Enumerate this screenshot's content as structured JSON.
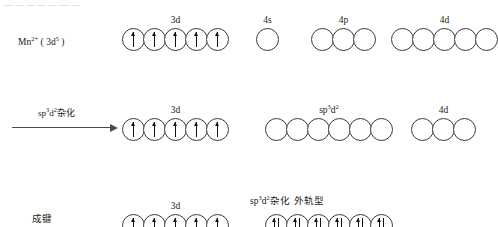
{
  "page": {
    "top_clipped_text": "— — — — — — —",
    "background": "#ffffff",
    "ink": "#1a1a1a"
  },
  "rows": [
    {
      "id": "row-1",
      "left_label_html": "Mn<sup>2+</sup> ( 3d<sup>5</sup> )",
      "left_label_text": "Mn2+ ( 3d5 )",
      "groups": [
        {
          "label": "3d",
          "label_text": "3d",
          "count": 5,
          "fill": "up",
          "left": 122,
          "touching": true
        },
        {
          "label": "4s",
          "label_text": "4s",
          "count": 1,
          "fill": "empty",
          "left": 256,
          "touching": true
        },
        {
          "label": "4p",
          "label_text": "4p",
          "count": 3,
          "fill": "empty",
          "left": 311,
          "touching": true
        },
        {
          "label": "4d",
          "label_text": "4d",
          "count": 5,
          "fill": "empty",
          "left": 391,
          "touching": true
        }
      ]
    },
    {
      "id": "row-2",
      "arrow_label_html": "sp<sup>3</sup>d<sup>2</sup>杂化",
      "arrow_label_text": "sp3d2 杂化",
      "groups": [
        {
          "label": "3d",
          "label_text": "3d",
          "count": 5,
          "fill": "up",
          "left": 122,
          "touching": true
        },
        {
          "label": "sp<sup>3</sup>d<sup>2</sup>",
          "label_text": "sp3d2",
          "count": 6,
          "fill": "empty",
          "left": 265,
          "touching": true
        },
        {
          "label": "4d",
          "label_text": "4d",
          "count": 3,
          "fill": "empty",
          "left": 411,
          "touching": true
        }
      ]
    },
    {
      "id": "row-3",
      "left_label_html": "成键",
      "left_label_text": "成键",
      "note_html": "sp<sup>3</sup>d<sup>2</sup>杂化　外轨型",
      "note_text": "sp3d2杂化 外轨型",
      "groups": [
        {
          "label": "3d",
          "label_text": "3d",
          "count": 5,
          "fill": "up",
          "left": 122,
          "touching": true
        },
        {
          "label": "",
          "label_text": "",
          "count": 6,
          "fill": "pair",
          "left": 265,
          "touching": true
        }
      ]
    }
  ]
}
